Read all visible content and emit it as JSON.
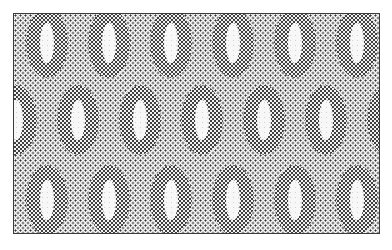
{
  "image": {
    "title": "Halftone ring-ellipse repeat pattern",
    "kind": "dithered-halftone-texture",
    "width": 392,
    "height": 250,
    "alt_text": "Staggered grid of dark halftone ring-shaped ellipses on a light dotted ground, enclosed in a thin rectangular border"
  },
  "colors": {
    "page_background": "#ffffff",
    "plate_background": "#f4f4f4",
    "ground_dot": "#1b1b1b",
    "ring_dark": "#2a2a2a",
    "ring_dot_light": "#f0f0f0",
    "hole_fill": "#f6f6f6",
    "border": "#3a3a3a"
  },
  "plate": {
    "left": 13,
    "top": 13,
    "width": 367,
    "height": 221,
    "border_width": 1,
    "ground_dot_pitch": 5,
    "ring_dot_pitch": 4
  },
  "pattern": {
    "ring_outer_width": 42,
    "ring_outer_height": 70,
    "ring_hole_width": 14,
    "ring_hole_height": 40,
    "column_pitch": 62,
    "row_pitch": 74,
    "stagger_offset": 31,
    "row_count": 3,
    "columns_per_row": 7
  },
  "rings": [
    {
      "row": 0,
      "col": 0,
      "cx": 47,
      "cy": 43
    },
    {
      "row": 0,
      "col": 1,
      "cx": 109,
      "cy": 43
    },
    {
      "row": 0,
      "col": 2,
      "cx": 171,
      "cy": 43
    },
    {
      "row": 0,
      "col": 3,
      "cx": 233,
      "cy": 43
    },
    {
      "row": 0,
      "col": 4,
      "cx": 295,
      "cy": 43
    },
    {
      "row": 0,
      "col": 5,
      "cx": 357,
      "cy": 43
    },
    {
      "row": 1,
      "col": 0,
      "cx": 16,
      "cy": 120
    },
    {
      "row": 1,
      "col": 1,
      "cx": 78,
      "cy": 120
    },
    {
      "row": 1,
      "col": 2,
      "cx": 140,
      "cy": 120
    },
    {
      "row": 1,
      "col": 3,
      "cx": 202,
      "cy": 120
    },
    {
      "row": 1,
      "col": 4,
      "cx": 264,
      "cy": 120
    },
    {
      "row": 1,
      "col": 5,
      "cx": 326,
      "cy": 120
    },
    {
      "row": 1,
      "col": 6,
      "cx": 388,
      "cy": 120
    },
    {
      "row": 2,
      "col": 0,
      "cx": 47,
      "cy": 200
    },
    {
      "row": 2,
      "col": 1,
      "cx": 109,
      "cy": 200
    },
    {
      "row": 2,
      "col": 2,
      "cx": 171,
      "cy": 200
    },
    {
      "row": 2,
      "col": 3,
      "cx": 233,
      "cy": 200
    },
    {
      "row": 2,
      "col": 4,
      "cx": 295,
      "cy": 200
    },
    {
      "row": 2,
      "col": 5,
      "cx": 357,
      "cy": 200
    }
  ]
}
